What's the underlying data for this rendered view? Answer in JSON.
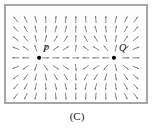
{
  "figure": {
    "caption": "(C)",
    "type": "vector-field-diagram",
    "border_color": "#a6a6a6",
    "background_color": "#fdfdfd",
    "arrow_color": "#6e6e6e",
    "charge_color": "#000000"
  },
  "charges": [
    {
      "id": "P",
      "label": "P",
      "sign": "positive",
      "x": 34,
      "y": 54,
      "label_dx": 4,
      "label_dy": -14
    },
    {
      "id": "Q",
      "label": "Q",
      "sign": "positive",
      "x": 111,
      "y": 54,
      "label_dx": 5,
      "label_dy": -15
    }
  ],
  "chart_data": {
    "type": "scatter",
    "title": "(C)",
    "xlabel": "",
    "ylabel": "",
    "grid": false,
    "legend": "none",
    "xlim": [
      0,
      144
    ],
    "ylim": [
      0,
      100
    ],
    "field": {
      "kind": "electric-field-vectors",
      "sources": [
        {
          "name": "P",
          "x": 34,
          "y": 54,
          "charge": 1
        },
        {
          "name": "Q",
          "x": 111,
          "y": 54,
          "charge": 1
        }
      ],
      "grid_columns": 13,
      "grid_rows": 9,
      "grid_x_start": 10,
      "grid_x_step": 10.3,
      "grid_y_start": 14,
      "grid_y_step": 10,
      "arrow_length": 6.5,
      "arrow_head_size": 1.9
    },
    "annotations": [
      {
        "text": "P",
        "x": 38,
        "y": 42
      },
      {
        "text": "Q",
        "x": 116,
        "y": 41
      }
    ]
  }
}
